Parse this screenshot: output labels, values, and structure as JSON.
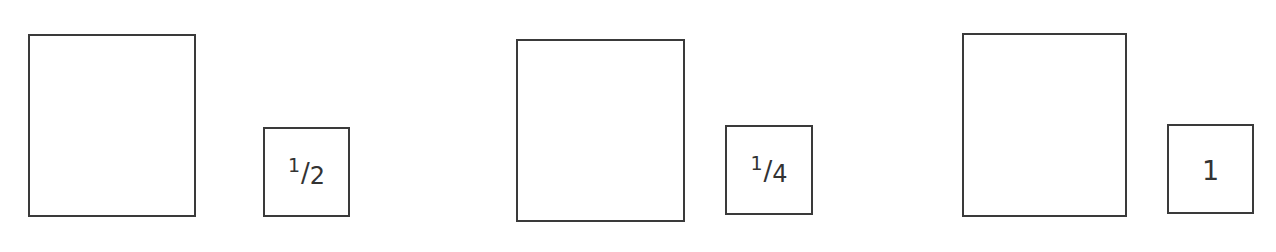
{
  "diagram": {
    "stroke_color": "#3a3a3a",
    "background_color": "#ffffff",
    "pairs": [
      {
        "large_square": {
          "label": ""
        },
        "small_square": {
          "label": "1/2",
          "numerator": "1",
          "slash": "/",
          "denominator": "2"
        }
      },
      {
        "large_square": {
          "label": ""
        },
        "small_square": {
          "label": "1/4",
          "numerator": "1",
          "slash": "/",
          "denominator": "4"
        }
      },
      {
        "large_square": {
          "label": ""
        },
        "small_square": {
          "label": "1",
          "value": "1"
        }
      }
    ]
  }
}
